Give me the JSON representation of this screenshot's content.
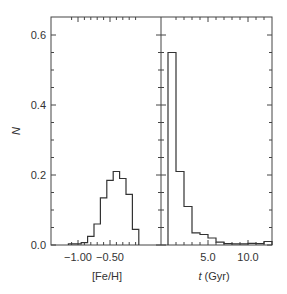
{
  "chart_data": [
    {
      "type": "bar",
      "title": "",
      "xlabel": "[Fe/H]",
      "ylabel": "N",
      "ylim": [
        0,
        0.65
      ],
      "xlim": [
        -1.15,
        -0.05
      ],
      "xticks": [
        "-1.00",
        "-0.50"
      ],
      "yticks": [
        "0.0",
        "0.2",
        "0.4",
        "0.6"
      ],
      "grid": false,
      "bin_edges": [
        -1.15,
        -1.05,
        -0.95,
        -0.85,
        -0.75,
        -0.65,
        -0.55,
        -0.45,
        -0.35,
        -0.25,
        -0.15,
        -0.05
      ],
      "values": [
        0.003,
        0.003,
        0.007,
        0.025,
        0.06,
        0.135,
        0.185,
        0.21,
        0.19,
        0.145,
        0.045
      ]
    },
    {
      "type": "bar",
      "title": "",
      "xlabel": "t (Gyr)",
      "ylabel": "N",
      "ylim": [
        0,
        0.65
      ],
      "xlim": [
        -0.9,
        13.0
      ],
      "xticks": [
        "5.0",
        "10.0"
      ],
      "grid": false,
      "bin_edges": [
        0,
        1,
        2,
        3,
        4,
        5,
        6,
        7,
        8,
        9,
        10,
        11,
        12,
        13
      ],
      "values": [
        0.55,
        0.21,
        0.11,
        0.035,
        0.03,
        0.02,
        0.008,
        0.004,
        0.003,
        0.003,
        0.005,
        0.004,
        0.01
      ]
    }
  ],
  "axes": {
    "ylabel": "N",
    "yticks": [
      "0.0",
      "0.2",
      "0.4",
      "0.6"
    ],
    "left_xlabel": "[Fe/H]",
    "left_xticks": [
      "−1.00",
      "−0.50"
    ],
    "right_xlabel_italic": "t",
    "right_xlabel_unit": "(Gyr)",
    "right_xticks": [
      "5.0",
      "10.0"
    ]
  }
}
